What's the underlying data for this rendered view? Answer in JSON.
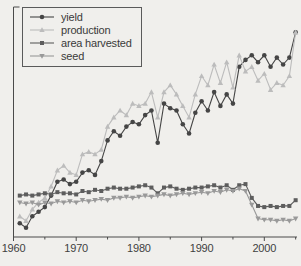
{
  "page": {
    "background_color": "#f0efec",
    "axis_color": "#4a4a4a",
    "tick_label_color": "#3f3f3f"
  },
  "legend": {
    "position": "upper-left",
    "border_color": "#5a5a5a",
    "items": [
      "yield",
      "production",
      "area harvested",
      "seed"
    ]
  },
  "axes": {
    "x_tick_labels": [
      "1960",
      "1970",
      "1980",
      "1990",
      "2000"
    ],
    "x_ticks_major": [
      1960,
      1970,
      1980,
      1990,
      2000
    ],
    "x_ticks_minor": [
      1965,
      1975,
      1985,
      1995,
      2005
    ],
    "y_axis_labels_visible": false
  },
  "chart_data": {
    "type": "line",
    "title": "",
    "xlabel": "",
    "ylabel": "",
    "x_range": [
      1960,
      2005.5
    ],
    "y_range_note": "y axis unlabeled; values are relative index 0-100 estimated from pixel positions",
    "ylim": [
      0,
      100
    ],
    "grid": false,
    "legend_position": "upper-left",
    "x": [
      1961,
      1962,
      1963,
      1964,
      1965,
      1966,
      1967,
      1968,
      1969,
      1970,
      1971,
      1972,
      1973,
      1974,
      1975,
      1976,
      1977,
      1978,
      1979,
      1980,
      1981,
      1982,
      1983,
      1984,
      1985,
      1986,
      1987,
      1988,
      1989,
      1990,
      1991,
      1992,
      1993,
      1994,
      1995,
      1996,
      1997,
      1998,
      1999,
      2000,
      2001,
      2002,
      2003,
      2004,
      2005
    ],
    "series": [
      {
        "name": "yield",
        "color": "#454545",
        "marker": "circle",
        "values": [
          6,
          4,
          9,
          11,
          13,
          18,
          24,
          25,
          23,
          24,
          28,
          29,
          27,
          33,
          42,
          46,
          44,
          48,
          50,
          49,
          53,
          55,
          41,
          58,
          56,
          55,
          49,
          45,
          54,
          59,
          55,
          63,
          57,
          62,
          58,
          74,
          77,
          79,
          76,
          79,
          74,
          78,
          75,
          78,
          89
        ]
      },
      {
        "name": "production",
        "color": "#bcbcbc",
        "marker": "triangle-up",
        "values": [
          9,
          7,
          12,
          15,
          17,
          22,
          29,
          31,
          28,
          27,
          36,
          37,
          36,
          38,
          48,
          52,
          55,
          53,
          58,
          57,
          58,
          63,
          52,
          63,
          66,
          62,
          57,
          52,
          62,
          70,
          66,
          75,
          67,
          76,
          65,
          79,
          72,
          74,
          68,
          71,
          64,
          67,
          66,
          70,
          89
        ]
      },
      {
        "name": "area harvested",
        "color": "#5d5d5d",
        "marker": "square",
        "values": [
          18,
          18.5,
          18,
          18.5,
          19,
          18.5,
          19.5,
          19,
          19,
          18.5,
          20,
          19.5,
          20.5,
          20,
          21,
          21.5,
          21,
          21,
          21.5,
          22,
          22.5,
          21.5,
          19,
          21.5,
          22,
          21,
          20.5,
          21,
          21.5,
          21.5,
          22,
          22.5,
          21.5,
          22.5,
          20.5,
          22.5,
          23,
          17,
          13.5,
          13,
          13.5,
          13,
          13.5,
          13.5,
          16
        ]
      },
      {
        "name": "seed",
        "color": "#999999",
        "marker": "triangle-down",
        "values": [
          15,
          14.5,
          15,
          14,
          15,
          14.5,
          15.5,
          15,
          15.5,
          15,
          16,
          15.5,
          16,
          16.5,
          16,
          17,
          17,
          17.5,
          17,
          17.5,
          18,
          17.5,
          18,
          18.5,
          18,
          18.5,
          19,
          18.5,
          19,
          19.5,
          19,
          20,
          19.5,
          20.5,
          20,
          21,
          20,
          14,
          8,
          7.5,
          7.5,
          7,
          7.5,
          7,
          8
        ]
      }
    ]
  }
}
